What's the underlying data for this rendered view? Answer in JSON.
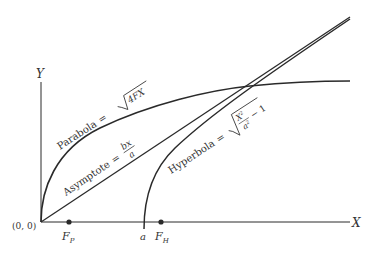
{
  "diagram": {
    "type": "conic-comparison",
    "axes": {
      "x_label": "X",
      "y_label": "Y",
      "origin_label": "(0, 0)"
    },
    "points": [
      {
        "id": "focus-parabola",
        "label": "F",
        "subscript": "P"
      },
      {
        "id": "focus-hyperbola",
        "label": "F",
        "subscript": "H"
      },
      {
        "id": "vertex-hyperbola",
        "label": "a"
      }
    ],
    "curves": {
      "parabola": {
        "name": "Parabola",
        "eq": "=",
        "radicand": "4FX"
      },
      "asymptote": {
        "name": "Asymptote",
        "eq": "=",
        "numerator": "bx",
        "denominator": "a"
      },
      "hyperbola": {
        "name": "Hyperbola",
        "eq": "=",
        "frac_num": "X",
        "frac_num_exp": "2",
        "frac_den": "a",
        "frac_den_exp": "2",
        "minus_one": "− 1"
      }
    },
    "colors": {
      "ink": "#2a2a2a",
      "background": "#ffffff"
    }
  }
}
